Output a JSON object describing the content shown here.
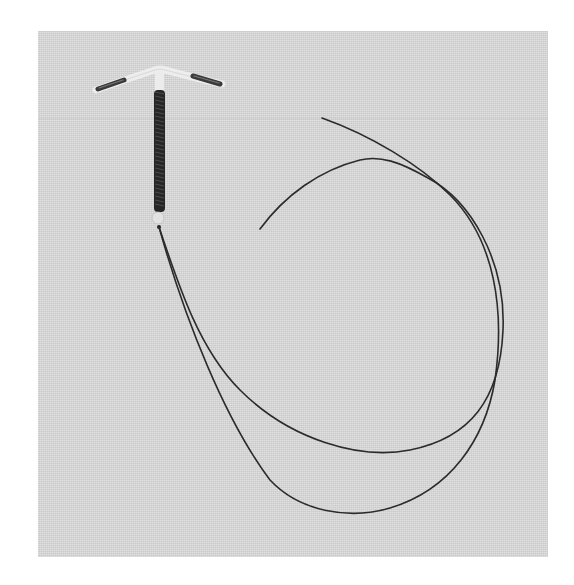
{
  "image": {
    "description": "Photograph of a copper T-shaped intrauterine device (IUD) with two long removal threads on a gray background",
    "subject": "copper T IUD",
    "colors": {
      "background_page": "#ffffff",
      "photo_background": "#d9d9d9",
      "copper_coil": "#2a2a2a",
      "plastic_frame": "#e8e8e8",
      "thread": "#2b2b2b"
    }
  }
}
